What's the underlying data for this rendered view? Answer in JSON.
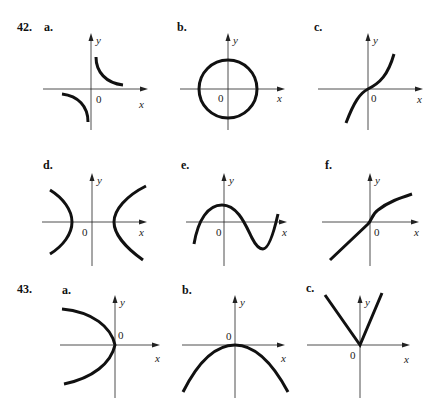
{
  "problems": [
    {
      "number": "42.",
      "graphs": [
        {
          "label": "a.",
          "description": "two hyperbola branches in quadrants I and III (y = 1/x shape)",
          "x_label": "x",
          "y_label": "y",
          "origin_label": "0"
        },
        {
          "label": "b.",
          "description": "circle centered at origin",
          "x_label": "x",
          "y_label": "y",
          "origin_label": "0"
        },
        {
          "label": "c.",
          "description": "cubic-like increasing curve through origin",
          "x_label": "x",
          "y_label": "y",
          "origin_label": "0"
        },
        {
          "label": "d.",
          "description": "horizontal hyperbola opening left and right",
          "x_label": "x",
          "y_label": "y",
          "origin_label": "0"
        },
        {
          "label": "e.",
          "description": "sine-like wave with peak near y-axis and trough to the right",
          "x_label": "x",
          "y_label": "y",
          "origin_label": "0"
        },
        {
          "label": "f.",
          "description": "increasing curve: straight line below origin, concave-down curve above",
          "x_label": "x",
          "y_label": "y",
          "origin_label": "0"
        }
      ]
    },
    {
      "number": "43.",
      "graphs": [
        {
          "label": "a.",
          "description": "parabola opening left with vertex at origin",
          "x_label": "x",
          "y_label": "y",
          "origin_label": "0"
        },
        {
          "label": "b.",
          "description": "parabola opening downward with vertex at origin",
          "x_label": "x",
          "y_label": "y",
          "origin_label": "0"
        },
        {
          "label": "c.",
          "description": "V-shape (absolute value) with vertex at origin",
          "x_label": "x",
          "y_label": "y",
          "origin_label": "0"
        }
      ]
    }
  ]
}
